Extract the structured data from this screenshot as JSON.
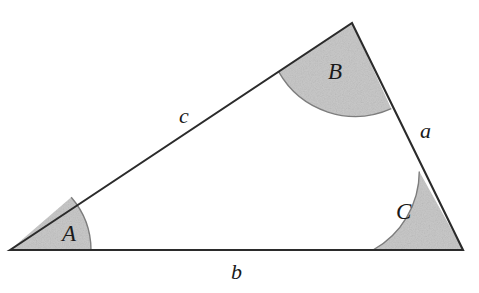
{
  "figure": {
    "background_color": "#ffffff",
    "stroke_color": "#2b2b2b",
    "shade_color": "#c9c9c9",
    "shade_edge_color": "#8a8a8a"
  },
  "vertices": {
    "A": {
      "label": "A",
      "x": 10,
      "y": 250
    },
    "B": {
      "label": "B",
      "x": 352,
      "y": 23
    },
    "C": {
      "label": "C",
      "x": 463,
      "y": 250
    }
  },
  "angles": [
    {
      "name": "angle-a",
      "label": "A",
      "vertex": "A",
      "radius": 81,
      "label_x": 62,
      "label_y": 222,
      "shaded": true
    },
    {
      "name": "angle-b",
      "label": "B",
      "vertex": "B",
      "radius": 88,
      "label_x": 328,
      "label_y": 60,
      "shaded": true
    },
    {
      "name": "angle-c",
      "label": "C",
      "vertex": "C",
      "radius": 90,
      "label_x": 396,
      "label_y": 200,
      "shaded": true
    }
  ],
  "sides": [
    {
      "name": "side-a",
      "label": "a",
      "between": "B-C",
      "label_x": 420,
      "label_y": 120
    },
    {
      "name": "side-b",
      "label": "b",
      "between": "A-C",
      "label_x": 231,
      "label_y": 261
    },
    {
      "name": "side-c",
      "label": "c",
      "between": "A-B",
      "label_x": 179,
      "label_y": 105
    }
  ]
}
